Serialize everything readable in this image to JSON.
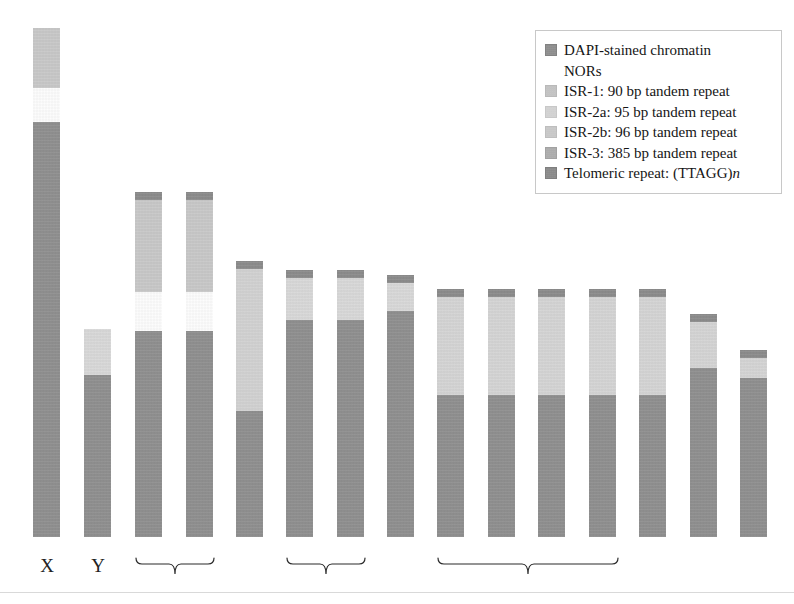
{
  "figure": {
    "background": "#ffffff"
  },
  "colors": {
    "dapi_chromatin": "#8e8e8e",
    "nors": "#ffffff",
    "isr_1": "#c9c9c9",
    "isr_2a": "#dadada",
    "isr_2b": "#cfcfcf",
    "isr_3": "#b0b0b0",
    "telomeric_repeat": "#8a8a8a"
  },
  "legend": {
    "name": "legend-box",
    "items": [
      {
        "key": "dapi_chromatin",
        "label": "DAPI-stained chromatin",
        "swatch": "#8e8e8e",
        "has_swatch": true
      },
      {
        "key": "nors",
        "label": "NORs",
        "swatch": "#ffffff",
        "has_swatch": false
      },
      {
        "key": "isr_1",
        "label": "ISR-1: 90 bp tandem repeat",
        "swatch": "#c9c9c9",
        "has_swatch": true
      },
      {
        "key": "isr_2a",
        "label": "ISR-2a: 95 bp tandem repeat",
        "swatch": "#dadada",
        "has_swatch": true
      },
      {
        "key": "isr_2b",
        "label": "ISR-2b: 96 bp tandem repeat",
        "swatch": "#cfcfcf",
        "has_swatch": true
      },
      {
        "key": "isr_3",
        "label": "ISR-3: 385 bp tandem repeat",
        "swatch": "#b0b0b0",
        "has_swatch": true
      },
      {
        "key": "telomeric",
        "label": "Telomeric repeat: (TTAGG)",
        "label_suffix_italic": "n",
        "swatch": "#8a8a8a",
        "has_swatch": true
      }
    ]
  },
  "axis_labels": [
    {
      "name": "chrom-label-x",
      "text": "X",
      "left": 33,
      "top": 556,
      "width": 28
    },
    {
      "name": "chrom-label-y",
      "text": "Y",
      "left": 84,
      "top": 556,
      "width": 28
    }
  ],
  "braces": [
    {
      "name": "brace-group-1",
      "left": 135,
      "top": 553,
      "width": 80,
      "height": 24
    },
    {
      "name": "brace-group-2",
      "left": 286,
      "top": 553,
      "width": 80,
      "height": 24
    },
    {
      "name": "brace-group-3",
      "left": 437,
      "top": 553,
      "width": 182,
      "height": 24
    }
  ],
  "chart_data": {
    "type": "bar",
    "xlabel": "",
    "ylabel": "",
    "grid": false,
    "legend_position": "top-right",
    "units": "pixels (relative chromosome length)",
    "categories": [
      "X",
      "Y",
      "1",
      "2",
      "3",
      "4",
      "5",
      "6",
      "7",
      "8",
      "9",
      "10",
      "11",
      "12"
    ],
    "bar_width": 27,
    "baseline_y": 537,
    "chromosomes": [
      {
        "id": "X",
        "label": "X",
        "left": 33,
        "top": 28,
        "segments": [
          {
            "key": "isr_1",
            "color": "#c9c9c9",
            "top": 28,
            "height": 60
          },
          {
            "key": "nors",
            "color": "#ffffff",
            "top": 88,
            "height": 34
          },
          {
            "key": "dapi",
            "color": "#8e8e8e",
            "top": 122,
            "height": 415
          }
        ]
      },
      {
        "id": "Y",
        "label": "Y",
        "left": 84,
        "top": 329,
        "segments": [
          {
            "key": "isr_2a",
            "color": "#dadada",
            "top": 329,
            "height": 46
          },
          {
            "key": "dapi",
            "color": "#8e8e8e",
            "top": 375,
            "height": 162
          }
        ]
      },
      {
        "id": "1",
        "label": "",
        "left": 135,
        "top": 192,
        "segments": [
          {
            "key": "telomeric",
            "color": "#8a8a8a",
            "top": 192,
            "height": 8
          },
          {
            "key": "isr_1",
            "color": "#c9c9c9",
            "top": 200,
            "height": 92
          },
          {
            "key": "nors",
            "color": "#ffffff",
            "top": 292,
            "height": 39
          },
          {
            "key": "dapi",
            "color": "#8e8e8e",
            "top": 331,
            "height": 206
          }
        ]
      },
      {
        "id": "2",
        "label": "",
        "left": 186,
        "top": 192,
        "segments": [
          {
            "key": "telomeric",
            "color": "#8a8a8a",
            "top": 192,
            "height": 8
          },
          {
            "key": "isr_1",
            "color": "#c9c9c9",
            "top": 200,
            "height": 92
          },
          {
            "key": "nors",
            "color": "#ffffff",
            "top": 292,
            "height": 39
          },
          {
            "key": "dapi",
            "color": "#8e8e8e",
            "top": 331,
            "height": 206
          }
        ]
      },
      {
        "id": "3",
        "label": "",
        "left": 236,
        "top": 261,
        "segments": [
          {
            "key": "telomeric",
            "color": "#8a8a8a",
            "top": 261,
            "height": 8
          },
          {
            "key": "isr_2b",
            "color": "#d3d3d3",
            "top": 269,
            "height": 142
          },
          {
            "key": "dapi",
            "color": "#8e8e8e",
            "top": 411,
            "height": 126
          }
        ]
      },
      {
        "id": "4",
        "label": "",
        "left": 286,
        "top": 270,
        "segments": [
          {
            "key": "telomeric",
            "color": "#8a8a8a",
            "top": 270,
            "height": 8
          },
          {
            "key": "isr_2a",
            "color": "#dadada",
            "top": 278,
            "height": 42
          },
          {
            "key": "dapi",
            "color": "#8e8e8e",
            "top": 320,
            "height": 217
          }
        ]
      },
      {
        "id": "5",
        "label": "",
        "left": 337,
        "top": 270,
        "segments": [
          {
            "key": "telomeric",
            "color": "#8a8a8a",
            "top": 270,
            "height": 8
          },
          {
            "key": "isr_2a",
            "color": "#dadada",
            "top": 278,
            "height": 42
          },
          {
            "key": "dapi",
            "color": "#8e8e8e",
            "top": 320,
            "height": 217
          }
        ]
      },
      {
        "id": "6",
        "label": "",
        "left": 387,
        "top": 275,
        "segments": [
          {
            "key": "telomeric",
            "color": "#8a8a8a",
            "top": 275,
            "height": 8
          },
          {
            "key": "isr_2a",
            "color": "#dadada",
            "top": 283,
            "height": 28
          },
          {
            "key": "dapi",
            "color": "#8e8e8e",
            "top": 311,
            "height": 226
          }
        ]
      },
      {
        "id": "7",
        "label": "",
        "left": 437,
        "top": 289,
        "segments": [
          {
            "key": "telomeric",
            "color": "#8a8a8a",
            "top": 289,
            "height": 8
          },
          {
            "key": "isr_2b",
            "color": "#d6d6d6",
            "top": 297,
            "height": 98
          },
          {
            "key": "dapi",
            "color": "#8e8e8e",
            "top": 395,
            "height": 142
          }
        ]
      },
      {
        "id": "8",
        "label": "",
        "left": 488,
        "top": 289,
        "segments": [
          {
            "key": "telomeric",
            "color": "#8a8a8a",
            "top": 289,
            "height": 8
          },
          {
            "key": "isr_2b",
            "color": "#d6d6d6",
            "top": 297,
            "height": 98
          },
          {
            "key": "dapi",
            "color": "#8e8e8e",
            "top": 395,
            "height": 142
          }
        ]
      },
      {
        "id": "9",
        "label": "",
        "left": 538,
        "top": 289,
        "segments": [
          {
            "key": "telomeric",
            "color": "#8a8a8a",
            "top": 289,
            "height": 8
          },
          {
            "key": "isr_2b",
            "color": "#d6d6d6",
            "top": 297,
            "height": 98
          },
          {
            "key": "dapi",
            "color": "#8e8e8e",
            "top": 395,
            "height": 142
          }
        ]
      },
      {
        "id": "10",
        "label": "",
        "left": 589,
        "top": 289,
        "segments": [
          {
            "key": "telomeric",
            "color": "#8a8a8a",
            "top": 289,
            "height": 8
          },
          {
            "key": "isr_2b",
            "color": "#d6d6d6",
            "top": 297,
            "height": 98
          },
          {
            "key": "dapi",
            "color": "#8e8e8e",
            "top": 395,
            "height": 142
          }
        ]
      },
      {
        "id": "11",
        "label": "",
        "left": 639,
        "top": 289,
        "segments": [
          {
            "key": "telomeric",
            "color": "#8a8a8a",
            "top": 289,
            "height": 8
          },
          {
            "key": "isr_2b",
            "color": "#d6d6d6",
            "top": 297,
            "height": 98
          },
          {
            "key": "dapi",
            "color": "#8e8e8e",
            "top": 395,
            "height": 142
          }
        ]
      },
      {
        "id": "12",
        "label": "",
        "left": 690,
        "top": 314,
        "segments": [
          {
            "key": "telomeric",
            "color": "#8a8a8a",
            "top": 314,
            "height": 8
          },
          {
            "key": "isr_2b",
            "color": "#d6d6d6",
            "top": 322,
            "height": 46
          },
          {
            "key": "dapi",
            "color": "#8e8e8e",
            "top": 368,
            "height": 169
          }
        ]
      },
      {
        "id": "13",
        "label": "",
        "left": 740,
        "top": 350,
        "segments": [
          {
            "key": "telomeric",
            "color": "#8a8a8a",
            "top": 350,
            "height": 8
          },
          {
            "key": "isr_2b",
            "color": "#d6d6d6",
            "top": 358,
            "height": 20
          },
          {
            "key": "dapi",
            "color": "#8e8e8e",
            "top": 378,
            "height": 159
          }
        ]
      }
    ]
  }
}
